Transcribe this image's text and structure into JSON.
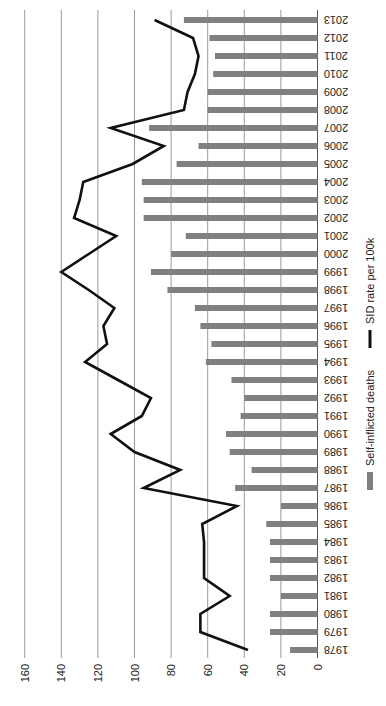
{
  "chart_data": {
    "type": "bar+line",
    "orientation": "rotated-90-clockwise",
    "title": "",
    "xlabel": "",
    "ylabel": "",
    "ylim": [
      0,
      160
    ],
    "yticks": [
      0,
      20,
      40,
      60,
      80,
      100,
      120,
      140,
      160
    ],
    "grid": true,
    "legend_position": "right (rotated, bottom of chart)",
    "categories": [
      "1978",
      "1979",
      "1980",
      "1981",
      "1982",
      "1983",
      "1984",
      "1985",
      "1986",
      "1987",
      "1988",
      "1989",
      "1990",
      "1991",
      "1992",
      "1993",
      "1994",
      "1995",
      "1996",
      "1997",
      "1998",
      "1999",
      "2000",
      "2001",
      "2002",
      "2003",
      "2004",
      "2005",
      "2006",
      "2007",
      "2008",
      "2009",
      "2010",
      "2011",
      "2012",
      "2013"
    ],
    "series": [
      {
        "name": "Self-inflicted deaths",
        "type": "bar",
        "color": "#808080",
        "values": [
          15,
          26,
          26,
          20,
          26,
          26,
          26,
          28,
          20,
          45,
          36,
          48,
          50,
          42,
          40,
          47,
          61,
          58,
          64,
          67,
          82,
          91,
          80,
          72,
          95,
          95,
          96,
          77,
          65,
          92,
          60,
          60,
          57,
          56,
          59,
          73
        ]
      },
      {
        "name": "SID rate per 100k",
        "type": "line",
        "color": "#111111",
        "values": [
          38,
          64,
          64,
          48,
          62,
          62,
          62,
          63,
          44,
          95,
          75,
          100,
          113,
          96,
          91,
          109,
          127,
          115,
          117,
          111,
          125,
          140,
          125,
          110,
          133,
          130,
          128,
          101,
          84,
          113,
          73,
          71,
          67,
          65,
          68,
          89
        ]
      }
    ]
  },
  "legend": {
    "items": [
      {
        "label": "Self-inflicted deaths",
        "color": "#808080",
        "shape": "bar"
      },
      {
        "label": "SID rate per 100k",
        "color": "#111111",
        "shape": "line"
      }
    ]
  },
  "colors": {
    "grid": "#9a9a9a",
    "axis": "#555555",
    "bar": "#808080",
    "line": "#111111"
  }
}
